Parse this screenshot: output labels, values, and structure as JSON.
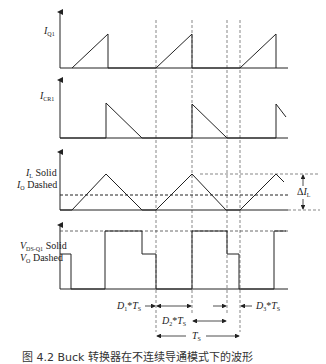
{
  "figure": {
    "panels": [
      {
        "id": "iq1",
        "label_main": "I",
        "label_sub": "Q1",
        "description": "Switch Q1 current"
      },
      {
        "id": "icr1",
        "label_main": "I",
        "label_sub": "CR1",
        "description": "Diode CR1 current"
      },
      {
        "id": "il",
        "line1_main": "I",
        "line1_sub": "L",
        "line1_suffix": " Solid",
        "line2_main": "I",
        "line2_sub": "O",
        "line2_suffix": " Dashed",
        "description": "Inductor current and output current"
      },
      {
        "id": "vds",
        "line1_main": "V",
        "line1_sub": "DS-Q1",
        "line1_suffix": " Solid",
        "line2_main": "V",
        "line2_sub": "O",
        "line2_suffix": " Dashed",
        "description": "Q1 drain-source voltage and output voltage"
      }
    ],
    "annotations": {
      "ripple": {
        "prefix": "Δ",
        "main": "I",
        "sub": "L"
      },
      "d1": {
        "main": "D",
        "sub1": "1",
        "star": "*",
        "t": "T",
        "sub2": "S"
      },
      "d2": {
        "main": "D",
        "sub1": "2",
        "star": "*",
        "t": "T",
        "sub2": "S"
      },
      "d3": {
        "main": "D",
        "sub1": "3",
        "star": "*",
        "t": "T",
        "sub2": "S"
      },
      "ts": {
        "main": "T",
        "sub": "S"
      }
    },
    "caption": "图 4.2  Buck 转换器在不连续导通模式下的波形"
  },
  "colors": {
    "line": "#222222",
    "dashed": "#444444",
    "background": "#ffffff"
  }
}
